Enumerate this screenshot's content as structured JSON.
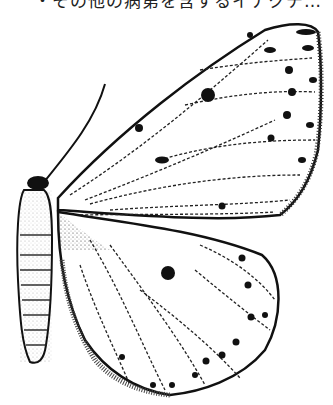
{
  "caption": {
    "text": "・その他の病第を含するイナクチ…"
  },
  "illustration": {
    "subject": "moth line drawing (dorsal view, left wings)",
    "ink_color": "#111111",
    "paper_color": "#ffffff"
  }
}
